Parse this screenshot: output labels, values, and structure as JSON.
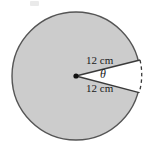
{
  "figure": {
    "background_color": "#ffffff",
    "circle": {
      "fill_color": "#cccccc",
      "stroke_color": "#555555",
      "center_x": 76,
      "center_y": 76,
      "radius": 64
    },
    "sector": {
      "fill_color": "#ffffff",
      "stroke_color": "#3a3a3a",
      "arc_style": "dashed",
      "vertex_marker": "center-dot"
    },
    "labels": {
      "radius_top": "12 cm",
      "radius_bottom": "12 cm",
      "angle": "θ"
    }
  }
}
